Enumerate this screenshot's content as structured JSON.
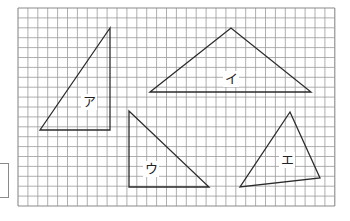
{
  "diagram": {
    "title": "",
    "grid": {
      "x": 18,
      "y": 8,
      "cols": 32,
      "rows": 20,
      "cell": 9.9,
      "line_color": "#9a9a9a",
      "border_color": "#8a8a8a"
    },
    "stroke_color": "#2b2b2b",
    "triangles": [
      {
        "id": "a",
        "label": "ア",
        "points": [
          [
            110,
            28
          ],
          [
            40,
            130
          ],
          [
            110,
            130
          ]
        ],
        "label_pos": [
          89,
          102
        ]
      },
      {
        "id": "i",
        "label": "イ",
        "points": [
          [
            150,
            92
          ],
          [
            231,
            28
          ],
          [
            311,
            92
          ]
        ],
        "label_pos": [
          231,
          79
        ]
      },
      {
        "id": "u",
        "label": "ウ",
        "points": [
          [
            129,
            111
          ],
          [
            129,
            187
          ],
          [
            209,
            187
          ]
        ],
        "label_pos": [
          151,
          169
        ]
      },
      {
        "id": "e",
        "label": "エ",
        "points": [
          [
            290,
            112
          ],
          [
            240,
            187
          ],
          [
            320,
            178
          ]
        ],
        "label_pos": [
          287,
          160
        ]
      }
    ],
    "answer_box": {
      "value": ""
    }
  }
}
